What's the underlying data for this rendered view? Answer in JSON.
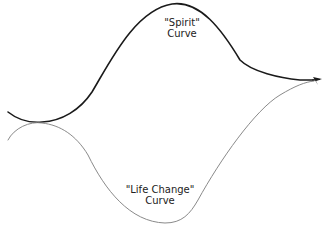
{
  "diagram": {
    "curves": [
      {
        "id": "spirit",
        "label_line1": "\"Spirit\"",
        "label_line2": "Curve",
        "color": "#1a1a1a"
      },
      {
        "id": "life-change",
        "label_line1": "\"Life Change\"",
        "label_line2": "Curve",
        "color": "#8a8a8a"
      }
    ],
    "arrow": {
      "icon": "arrowhead-icon",
      "color": "#1a1a1a"
    }
  }
}
